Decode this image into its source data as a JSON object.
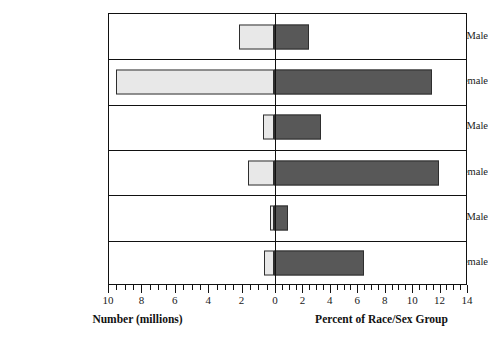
{
  "chart_data": {
    "type": "bar",
    "title": "",
    "orientation": "horizontal",
    "layout": "dual-axis diverging bars, zero at center",
    "grid": false,
    "legend": "none",
    "categories": [
      "White Male",
      "White Female",
      "Black Male",
      "Black Female",
      "Hispanic Male",
      "Hispanic Female"
    ],
    "series": [
      {
        "name": "Number (millions)",
        "side": "left",
        "axis_label": "Number (millions)",
        "fill_color": "#e8e8e8",
        "ticks": [
          10,
          8,
          6,
          4,
          2,
          0
        ],
        "tick_labels": [
          "10",
          "8",
          "6",
          "4",
          "2",
          "0"
        ],
        "axis_range": [
          10,
          0
        ],
        "minor_tick_step": 0.5,
        "major_tick_step": 2,
        "values": [
          2.1,
          9.5,
          0.7,
          1.6,
          0.25,
          0.6
        ]
      },
      {
        "name": "Percent of Race/Sex Group",
        "side": "right",
        "axis_label": "Percent of Race/Sex Group",
        "fill_color": "#585858",
        "ticks": [
          0,
          2,
          4,
          6,
          8,
          10,
          12,
          14
        ],
        "tick_labels": [
          "0",
          "2",
          "4",
          "6",
          "8",
          "10",
          "12",
          "14"
        ],
        "axis_range": [
          0,
          14
        ],
        "minor_tick_step": 0.5,
        "major_tick_step": 2,
        "values": [
          2.5,
          11.5,
          3.4,
          12.0,
          1.0,
          6.5
        ]
      }
    ]
  },
  "axis": {
    "left_title": "Number (millions)",
    "right_title": "Percent of Race/Sex Group"
  },
  "colors": {
    "left_bar": "#e8e8e8",
    "right_bar": "#585858",
    "bar_stroke": "#2e2e2e",
    "frame": "#111111",
    "background": "#ffffff"
  }
}
